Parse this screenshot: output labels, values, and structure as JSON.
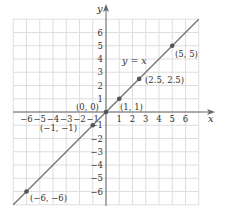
{
  "chart_data": {
    "type": "line",
    "title": "",
    "xlabel": "x",
    "ylabel": "y",
    "xlim": [
      -7,
      7
    ],
    "ylim": [
      -7,
      7
    ],
    "grid": true,
    "x_ticks": [
      -6,
      -5,
      -4,
      -3,
      -2,
      -1,
      1,
      2,
      3,
      4,
      5,
      6
    ],
    "y_ticks": [
      -6,
      -5,
      -4,
      -3,
      -2,
      -1,
      1,
      2,
      3,
      4,
      5,
      6
    ],
    "x_tick_labels": [
      "−6",
      "−5",
      "−4",
      "−3",
      "−2",
      "−1",
      "1",
      "2",
      "3",
      "4",
      "5",
      "6"
    ],
    "y_tick_labels": [
      "−6",
      "−5",
      "−4",
      "−3",
      "−2",
      "−1",
      "1",
      "2",
      "3",
      "4",
      "5",
      "6"
    ],
    "series": [
      {
        "name": "y = x",
        "equation": "y = x",
        "x": [
          -7,
          7
        ],
        "y": [
          -7,
          7
        ]
      }
    ],
    "points": [
      {
        "x": -6,
        "y": -6,
        "label": "(−6, −6)"
      },
      {
        "x": -1,
        "y": -1,
        "label": "(−1, −1)"
      },
      {
        "x": 0,
        "y": 0,
        "label": "(0, 0)"
      },
      {
        "x": 1,
        "y": 1,
        "label": "(1, 1)"
      },
      {
        "x": 2.5,
        "y": 2.5,
        "label": "(2.5, 2.5)"
      },
      {
        "x": 5,
        "y": 5,
        "label": "(5, 5)"
      }
    ],
    "annotations": [
      {
        "text": "y = x",
        "near": [
          2.2,
          3.8
        ]
      }
    ]
  },
  "labels": {
    "x_axis": "x",
    "y_axis": "y",
    "equation": "y = x",
    "pt_m6": "(−6, −6)",
    "pt_m1": "(−1, −1)",
    "pt_0": "(0, 0)",
    "pt_1": "(1, 1)",
    "pt_25": "(2.5, 2.5)",
    "pt_5": "(5, 5)"
  },
  "colors": {
    "grid": "#dedede",
    "axis": "#666666",
    "line": "#777777",
    "point": "#555555",
    "text": "#333333"
  }
}
